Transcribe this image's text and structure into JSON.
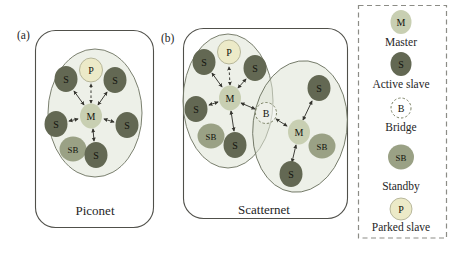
{
  "colors": {
    "master_fill": "#c8cfb2",
    "active_slave_fill": "#636853",
    "standby_fill": "#9aa185",
    "parked_slave_fill": "#eceac8",
    "bridge_outline": "#7d8367",
    "piconet_area_fill": "#dfe3d6",
    "piconet_area_stroke": "#6d7361",
    "panel_box_stroke": "#50504a",
    "arrow": "#35352f",
    "legend_border": "#8c8c86",
    "text": "#26261f"
  },
  "panel_a": {
    "label": "(a)",
    "caption": "Piconet",
    "nodes": {
      "p": "P",
      "s_tl": "S",
      "s_tr": "S",
      "m": "M",
      "s_l": "S",
      "s_r": "S",
      "sb": "SB",
      "s_b": "S"
    }
  },
  "panel_b": {
    "label": "(b)",
    "caption": "Scatternet",
    "left_nodes": {
      "p": "P",
      "s_tl": "S",
      "s_tr": "S",
      "m": "M",
      "s_l": "S",
      "sb": "SB",
      "s_b": "S",
      "b": "B"
    },
    "right_nodes": {
      "s_t": "S",
      "m": "M",
      "sb": "SB",
      "s_b": "S"
    }
  },
  "legend": {
    "items": [
      {
        "symbol": "M",
        "label": "Master"
      },
      {
        "symbol": "S",
        "label": "Active slave"
      },
      {
        "symbol": "B",
        "label": "Bridge"
      },
      {
        "symbol": "SB",
        "label": "Standby"
      },
      {
        "symbol": "P",
        "label": "Parked slave"
      }
    ]
  }
}
